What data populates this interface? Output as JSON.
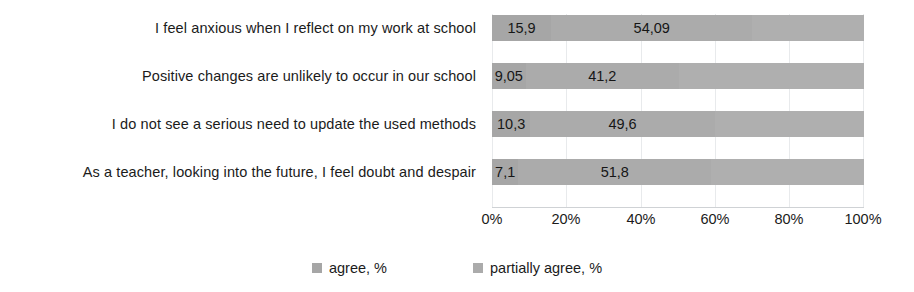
{
  "chart_data": {
    "type": "bar",
    "orientation": "horizontal",
    "stacked": true,
    "title": "",
    "xlabel": "",
    "ylabel": "",
    "xlim": [
      0,
      100
    ],
    "grid": true,
    "legend_position": "bottom",
    "xticks": [
      "0%",
      "20%",
      "40%",
      "60%",
      "80%",
      "100%"
    ],
    "xtick_values": [
      0,
      20,
      40,
      60,
      80,
      100
    ],
    "categories": [
      "I feel anxious when I reflect on my work at school",
      "Positive changes are unlikely to occur in our school",
      "I do not see a serious need to update the used methods",
      "As a teacher, looking into the future, I feel doubt and despair"
    ],
    "series": [
      {
        "name": "agree, %",
        "color": "#a6a6a6",
        "values": [
          15.9,
          9.05,
          10.3,
          7.1
        ],
        "labels": [
          "15,9",
          "9,05",
          "10,3",
          "7,1"
        ]
      },
      {
        "name": "partially agree, %",
        "color": "#ababab",
        "values": [
          54.09,
          41.2,
          49.6,
          51.8
        ],
        "labels": [
          "54,09",
          "41,2",
          "49,6",
          "51,8"
        ]
      }
    ]
  },
  "legend": {
    "items": [
      {
        "label": "agree, %",
        "color": "#a6a6a6"
      },
      {
        "label": "partially agree, %",
        "color": "#ababab"
      }
    ]
  }
}
